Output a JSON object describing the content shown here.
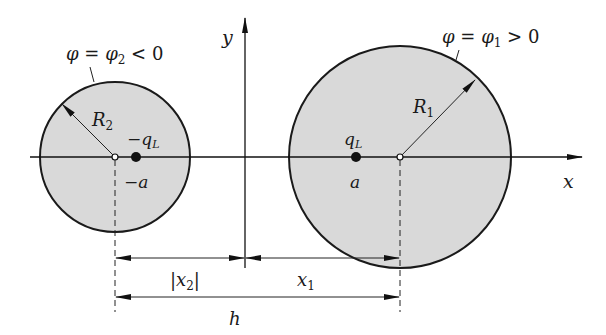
{
  "figure": {
    "axes": {
      "x_label": "x",
      "y_label": "y"
    },
    "left_cylinder": {
      "potential_label_lhs": "φ = φ",
      "potential_label_sub": "2",
      "potential_label_rhs": " < 0",
      "radius_label": "R",
      "radius_sub": "2",
      "charge_label": "−q",
      "charge_sub": "L",
      "charge_position_label": "−a",
      "fill_color": "#d9d9d9"
    },
    "right_cylinder": {
      "potential_label_lhs": "φ = φ",
      "potential_label_sub": "1",
      "potential_label_rhs": " > 0",
      "radius_label": "R",
      "radius_sub": "1",
      "charge_label": "q",
      "charge_sub": "L",
      "charge_position_label": "a",
      "fill_color": "#d9d9d9"
    },
    "dimensions": {
      "x2_label": "|x",
      "x2_sub": "2",
      "x2_close": "|",
      "x1_label": "x",
      "x1_sub": "1",
      "h_label": "h"
    }
  }
}
